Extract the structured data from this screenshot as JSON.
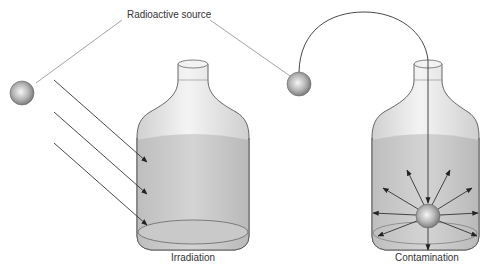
{
  "labels": {
    "source": "Radioactive source",
    "left_caption": "Irradiation",
    "right_caption": "Contamination"
  },
  "colors": {
    "line": "#555555",
    "arrow": "#222222",
    "bottle_outline": "#555555",
    "liquid": "#c4c4c4",
    "glass": "#e6e6e6",
    "sphere_light": "#f2f2f2",
    "sphere_dark": "#7a7a7a"
  },
  "scenes": [
    {
      "name": "irradiation",
      "description": "External radioactive source emits rays that pass into the bottle; the contents are irradiated but the source stays outside."
    },
    {
      "name": "contamination",
      "description": "The radioactive source is placed inside the bottle and emits radiation in all directions from within the liquid."
    }
  ]
}
